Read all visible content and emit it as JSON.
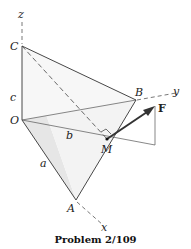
{
  "figure": {
    "caption": "Problem 2/109",
    "labels": {
      "z": "z",
      "y": "y",
      "x": "x",
      "C": "C",
      "O": "O",
      "B": "B",
      "A": "A",
      "M": "M",
      "F": "F",
      "a": "a",
      "b": "b",
      "c": "c"
    },
    "colors": {
      "line": "#333333",
      "face_light": "#f2f2f2",
      "face_mid": "#e4e4e4",
      "force_arrow": "#333333"
    }
  }
}
